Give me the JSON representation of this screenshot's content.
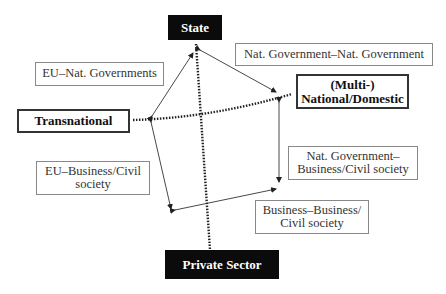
{
  "diagram": {
    "axes": {
      "top": "State",
      "bottom": "Private Sector",
      "left": "Transnational",
      "right_line1": "(Multi-)",
      "right_line2": "National/Domestic"
    },
    "relations": {
      "eu_nat_gov": "EU–Nat. Governments",
      "nat_gov_nat_gov": "Nat. Government–Nat. Government",
      "eu_business_line1": "EU–Business/Civil",
      "eu_business_line2": "society",
      "nat_gov_business_line1": "Nat. Government–",
      "nat_gov_business_line2": "Business/Civil society",
      "business_business_line1": "Business–Business/",
      "business_business_line2": "Civil society"
    },
    "colors": {
      "dark_box": "#0b0b0b",
      "line": "#333333"
    }
  }
}
